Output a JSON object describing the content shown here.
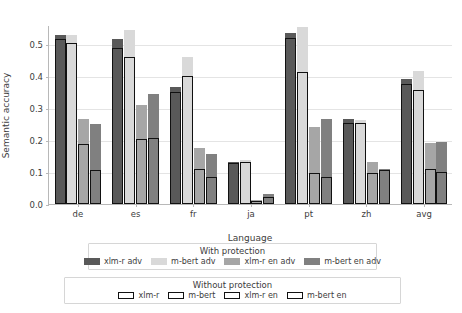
{
  "chart_data": {
    "type": "bar",
    "title": "",
    "xlabel": "Language",
    "ylabel": "Semantic accuracy",
    "categories": [
      "de",
      "es",
      "fr",
      "ja",
      "pt",
      "zh",
      "avg"
    ],
    "ylim": [
      0.0,
      0.56
    ],
    "yticks": [
      0.0,
      0.1,
      0.2,
      0.3,
      0.4,
      0.5
    ],
    "ytick_labels": [
      "0.0",
      "0.1",
      "0.2",
      "0.3",
      "0.4",
      "0.5"
    ],
    "grid": true,
    "legend_position": "below-axes",
    "legends": [
      {
        "title": "With protection",
        "entries": [
          {
            "label": "xlm-r adv",
            "color": "#595959",
            "style": "filled"
          },
          {
            "label": "m-bert adv",
            "color": "#d9d9d9",
            "style": "filled"
          },
          {
            "label": "xlm-r en adv",
            "color": "#a6a6a6",
            "style": "filled"
          },
          {
            "label": "m-bert en adv",
            "color": "#808080",
            "style": "filled"
          }
        ]
      },
      {
        "title": "Without protection",
        "entries": [
          {
            "label": "xlm-r",
            "color": "#111111",
            "style": "hollow"
          },
          {
            "label": "m-bert",
            "color": "#111111",
            "style": "hollow"
          },
          {
            "label": "xlm-r en",
            "color": "#111111",
            "style": "hollow"
          },
          {
            "label": "m-bert en",
            "color": "#111111",
            "style": "hollow"
          }
        ]
      }
    ],
    "series": [
      {
        "name": "xlm-r adv",
        "color": "#595959",
        "style": "filled",
        "values": [
          0.53,
          0.515,
          0.365,
          0.133,
          0.535,
          0.265,
          0.39
        ]
      },
      {
        "name": "m-bert adv",
        "color": "#d9d9d9",
        "style": "filled",
        "values": [
          0.53,
          0.545,
          0.46,
          0.137,
          0.555,
          0.262,
          0.415
        ]
      },
      {
        "name": "xlm-r en adv",
        "color": "#a6a6a6",
        "style": "filled",
        "values": [
          0.265,
          0.31,
          0.175,
          0.013,
          0.24,
          0.13,
          0.19
        ]
      },
      {
        "name": "m-bert en adv",
        "color": "#808080",
        "style": "filled",
        "values": [
          0.25,
          0.345,
          0.155,
          0.03,
          0.265,
          0.11,
          0.195
        ]
      },
      {
        "name": "xlm-r",
        "color": "#111111",
        "style": "hollow",
        "values": [
          0.517,
          0.487,
          0.352,
          0.128,
          0.52,
          0.252,
          0.375
        ]
      },
      {
        "name": "m-bert",
        "color": "#111111",
        "style": "hollow",
        "values": [
          0.503,
          0.46,
          0.4,
          0.133,
          0.412,
          0.255,
          0.358
        ]
      },
      {
        "name": "xlm-r en",
        "color": "#111111",
        "style": "hollow",
        "values": [
          0.188,
          0.203,
          0.108,
          0.01,
          0.097,
          0.098,
          0.108
        ]
      },
      {
        "name": "m-bert en",
        "color": "#111111",
        "style": "hollow",
        "values": [
          0.105,
          0.208,
          0.085,
          0.022,
          0.085,
          0.105,
          0.1
        ]
      }
    ]
  }
}
